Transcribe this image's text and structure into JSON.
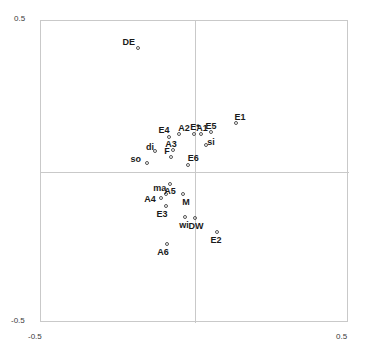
{
  "chart_data": {
    "type": "scatter",
    "title": "",
    "subtitle": "",
    "xlabel": "",
    "ylabel": "",
    "xlim": [
      -0.5,
      0.5
    ],
    "ylim": [
      -0.5,
      0.5
    ],
    "xticks": [
      "-0.5",
      "0.5"
    ],
    "yticks": [
      "0.5",
      "-0.5"
    ],
    "grid": false,
    "legend": null,
    "axes_cross_at": [
      0.0,
      0.0
    ],
    "marker": "open-circle",
    "points": [
      {
        "label": "DE",
        "x": -0.182,
        "y": 0.407,
        "lx": -0.215,
        "ly": 0.43
      },
      {
        "label": "E4",
        "x": -0.081,
        "y": 0.113,
        "lx": -0.101,
        "ly": 0.139
      },
      {
        "label": "A2",
        "x": -0.049,
        "y": 0.123,
        "lx": -0.036,
        "ly": 0.146
      },
      {
        "label": "E*",
        "x": 0.0,
        "y": 0.123,
        "lx": 0.0,
        "ly": 0.149
      },
      {
        "label": "A1",
        "x": 0.023,
        "y": 0.123,
        "lx": 0.023,
        "ly": 0.146
      },
      {
        "label": "E5",
        "x": 0.055,
        "y": 0.13,
        "lx": 0.052,
        "ly": 0.152
      },
      {
        "label": "E1",
        "x": 0.136,
        "y": 0.159,
        "lx": 0.146,
        "ly": 0.182
      },
      {
        "label": "si",
        "x": 0.039,
        "y": 0.087,
        "lx": 0.052,
        "ly": 0.1
      },
      {
        "label": "di",
        "x": -0.127,
        "y": 0.065,
        "lx": -0.146,
        "ly": 0.084
      },
      {
        "label": "A3",
        "x": -0.068,
        "y": 0.071,
        "lx": -0.078,
        "ly": 0.094
      },
      {
        "label": "F",
        "x": -0.075,
        "y": 0.045,
        "lx": -0.091,
        "ly": 0.068
      },
      {
        "label": "so",
        "x": -0.153,
        "y": 0.026,
        "lx": -0.192,
        "ly": 0.042
      },
      {
        "label": "E6",
        "x": -0.019,
        "y": 0.019,
        "lx": -0.006,
        "ly": 0.045
      },
      {
        "label": "ma",
        "x": -0.078,
        "y": -0.042,
        "lx": -0.114,
        "ly": -0.052
      },
      {
        "label": "A5",
        "x": -0.091,
        "y": -0.075,
        "lx": -0.081,
        "ly": -0.062
      },
      {
        "label": "A4",
        "x": -0.107,
        "y": -0.088,
        "lx": -0.146,
        "ly": -0.091
      },
      {
        "label": "M",
        "x": -0.036,
        "y": -0.075,
        "lx": -0.029,
        "ly": -0.098
      },
      {
        "label": "E3",
        "x": -0.091,
        "y": -0.117,
        "lx": -0.107,
        "ly": -0.14
      },
      {
        "label": "wi",
        "x": -0.029,
        "y": -0.153,
        "lx": -0.036,
        "ly": -0.176
      },
      {
        "label": "DW",
        "x": 0.003,
        "y": -0.156,
        "lx": 0.003,
        "ly": -0.179
      },
      {
        "label": "E2",
        "x": 0.075,
        "y": -0.202,
        "lx": 0.068,
        "ly": -0.225
      },
      {
        "label": "A6",
        "x": -0.088,
        "y": -0.241,
        "lx": -0.104,
        "ly": -0.264
      }
    ]
  }
}
